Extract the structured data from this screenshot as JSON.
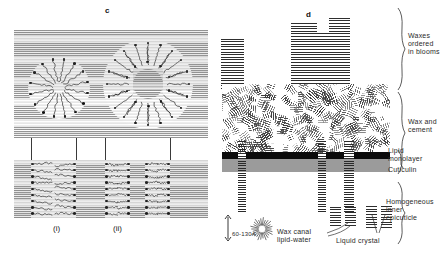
{
  "figure": {
    "panels": [
      {
        "letter": "c",
        "name": "wax-canal-lipid-organisation"
      },
      {
        "letter": "d",
        "name": "epicuticle-cross-section"
      }
    ]
  },
  "panel_c": {
    "letter": "c",
    "sublabels": [
      {
        "text": "(i)",
        "name": "sublabel-i"
      },
      {
        "text": "(ii)",
        "name": "sublabel-ii"
      }
    ],
    "features": {
      "micelle_small": "lipid-water micelle, polar heads outward",
      "micelle_large": "annular inverse micelle with hatched core",
      "channel_wide": "wide wax canal in (i)",
      "channel_narrow": "narrow paired wax canals in (ii)"
    }
  },
  "panel_d": {
    "letter": "d",
    "layer_labels": [
      {
        "text": "Waxes\nordered\nin blooms",
        "name": "layer-label-waxes-ordered-in-blooms"
      },
      {
        "text": "Wax and\ncement",
        "name": "layer-label-wax-and-cement"
      },
      {
        "text": "Lipid\nmonolayer",
        "name": "layer-label-lipid-monolayer"
      },
      {
        "text": "Cuticulin",
        "name": "layer-label-cuticulin"
      },
      {
        "text": "Homogeneous\ninner\nepicuticle",
        "name": "layer-label-homogeneous-inner-epicuticle"
      }
    ]
  },
  "legend": {
    "scale": "60-130A",
    "items": [
      {
        "text": "Wax canal\nlipid-water",
        "name": "legend-wax-canal-lipid-water"
      },
      {
        "text": "Liquid crystal",
        "name": "legend-liquid-crystal"
      }
    ]
  },
  "colors": {
    "ink": "#1a1a1a",
    "cuticulin": "#0b0b0b",
    "epicuticle": "#9b9b9b",
    "hatch": "#4a4a4a",
    "background": "#ffffff"
  }
}
